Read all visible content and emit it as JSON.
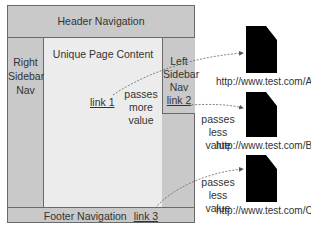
{
  "diagram": {
    "page": {
      "header_label": "Header Navigation",
      "left_sidebar_lines": [
        "Right",
        "Sidebar",
        "Nav"
      ],
      "main_label": "Unique Page Content",
      "right_sidebar_lines": [
        "Left",
        "Sidebar",
        "Nav"
      ],
      "footer_label": "Footer Navigation"
    },
    "links": [
      {
        "label": "link 1",
        "note_lines": [
          "passes",
          "more value"
        ],
        "target": "http://www.test.com/A"
      },
      {
        "label": "link 2",
        "note_lines": [
          "passes",
          "less value"
        ],
        "target": "http://www.test.com/B"
      },
      {
        "label": "link 3",
        "note_lines": [
          "passes",
          "less value"
        ],
        "target": "http://www.test.com/C"
      }
    ],
    "documents": [
      {
        "url": "http://www.test.com/A",
        "icon": "document-icon"
      },
      {
        "url": "http://www.test.com/B",
        "icon": "document-icon"
      },
      {
        "url": "http://www.test.com/C",
        "icon": "document-icon"
      }
    ],
    "colors": {
      "nav_fill": "#c9c9c9",
      "content_fill": "#ececec",
      "border": "#6a6a6a",
      "document": "#000000",
      "arrow": "#555555"
    }
  }
}
